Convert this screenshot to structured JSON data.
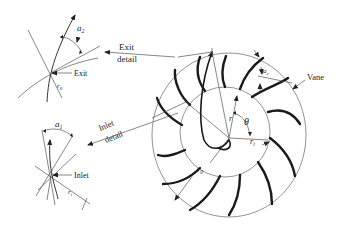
{
  "figure": {
    "labels": {
      "exit_detail_line1": "Exit",
      "exit_detail_line2": "detail",
      "exit_point": "Exit",
      "alpha2": "a",
      "alpha2_sub": "2",
      "r0_exit": "r",
      "r0_exit_sub": "0",
      "inlet_detail_line1": "Inlet",
      "inlet_detail_line2": "detail",
      "inlet_point": "Inlet",
      "alpha1": "a",
      "alpha1_sub": "1",
      "ri_inlet": "r",
      "ri_inlet_sub": "i",
      "vane": "Vane",
      "ac": "a",
      "ac_sub": "c",
      "r": "r",
      "theta": "θ",
      "ri": "r",
      "ri_sub": "i",
      "r0": "r",
      "r0_sub": "0"
    },
    "colors": {
      "line": "#333333",
      "vane": "#1a1a1a",
      "background": "#ffffff"
    }
  }
}
